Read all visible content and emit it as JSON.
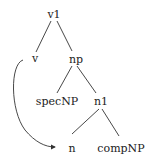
{
  "diagram": {
    "type": "syntax-tree",
    "nodes": {
      "v1": {
        "label": "v1",
        "x": 54,
        "y": 14
      },
      "v": {
        "label": "v",
        "x": 35,
        "y": 59
      },
      "np": {
        "label": "np",
        "x": 76,
        "y": 59
      },
      "specNP": {
        "label": "specNP",
        "x": 58,
        "y": 101
      },
      "n1": {
        "label": "n1",
        "x": 101,
        "y": 101
      },
      "n": {
        "label": "n",
        "x": 72,
        "y": 148
      },
      "compNP": {
        "label": "compNP",
        "x": 121,
        "y": 148
      }
    },
    "edges": [
      [
        "v1",
        "v"
      ],
      [
        "v1",
        "np"
      ],
      [
        "np",
        "specNP"
      ],
      [
        "np",
        "n1"
      ],
      [
        "n1",
        "n"
      ],
      [
        "n1",
        "compNP"
      ]
    ],
    "movement_arrow": {
      "from": "v",
      "to": "n"
    },
    "line_color": "#333333"
  }
}
